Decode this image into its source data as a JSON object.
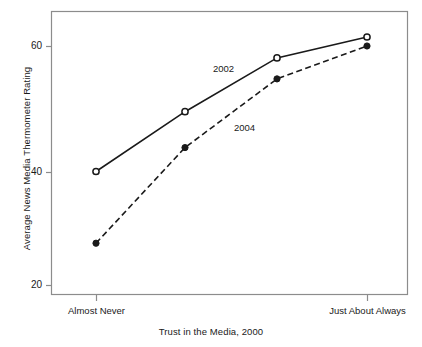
{
  "chart_data": {
    "type": "line",
    "title": "",
    "subtitle": "",
    "xlabel": "Trust in the Media, 2000",
    "ylabel": "Average News Media Thermometer Rating",
    "categories": [
      "Almost Never",
      "",
      "",
      "Just About Always"
    ],
    "x_tick_labels": [
      "Almost Never",
      "Just About Always"
    ],
    "y_tick_labels": [
      "20",
      "40",
      "60"
    ],
    "y_ticks": [
      20,
      40,
      60
    ],
    "ylim": [
      18,
      66
    ],
    "xlim": [
      0,
      3
    ],
    "grid": false,
    "legend_position": "inline-annotation",
    "series": [
      {
        "name": "2002",
        "style": "solid",
        "marker": "open-circle",
        "values": [
          39,
          49,
          58,
          61.5
        ],
        "annotation": "2002"
      },
      {
        "name": "2004",
        "style": "dashed",
        "marker": "filled-circle",
        "values": [
          27,
          43,
          54.5,
          60
        ],
        "annotation": "2004"
      }
    ],
    "colors": {
      "line": "#1a1a1a",
      "frame": "#808080",
      "background": "#ffffff"
    }
  },
  "labels": {
    "x_left": "Almost Never",
    "x_right": "Just About Always",
    "y_60": "60",
    "y_40": "40",
    "y_20": "20",
    "series_2002": "2002",
    "series_2004": "2004",
    "x_axis_title": "Trust in the Media, 2000",
    "y_axis_title": "Average News Media Thermometer Rating"
  }
}
